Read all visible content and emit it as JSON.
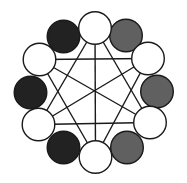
{
  "diagram": {
    "width": 187,
    "height": 183,
    "background": "#ffffff",
    "stroke_color": "#1a1a1a",
    "stroke_width": 1.4,
    "radius": 16.3,
    "colors": {
      "white": "#ffffff",
      "dark": "#222222",
      "gray": "#606060"
    },
    "nodes": [
      {
        "id": "top-left-dark",
        "type": "dark",
        "cx": 63.5,
        "cy": 36.5
      },
      {
        "id": "top-right-gray",
        "type": "gray",
        "cx": 126,
        "cy": 35.5
      },
      {
        "id": "left-dark",
        "type": "dark",
        "cx": 30.5,
        "cy": 92.5
      },
      {
        "id": "right-gray",
        "type": "gray",
        "cx": 157,
        "cy": 91.5
      },
      {
        "id": "bottom-left-dark",
        "type": "dark",
        "cx": 63.5,
        "cy": 147.5
      },
      {
        "id": "bottom-right-gray",
        "type": "gray",
        "cx": 127,
        "cy": 147.5
      },
      {
        "id": "top-white",
        "type": "white",
        "cx": 95,
        "cy": 28
      },
      {
        "id": "upper-left-white",
        "type": "white",
        "cx": 39.5,
        "cy": 59.5
      },
      {
        "id": "upper-right-white",
        "type": "white",
        "cx": 148,
        "cy": 58.5
      },
      {
        "id": "lower-left-white",
        "type": "white",
        "cx": 38.5,
        "cy": 124.5
      },
      {
        "id": "lower-right-white",
        "type": "white",
        "cx": 150,
        "cy": 122.5
      },
      {
        "id": "bottom-white",
        "type": "white",
        "cx": 95.5,
        "cy": 157
      }
    ],
    "edges": [
      [
        "upper-left-white",
        "upper-right-white"
      ],
      [
        "lower-left-white",
        "lower-right-white"
      ],
      [
        "top-white",
        "bottom-white"
      ],
      [
        "top-white",
        "lower-left-white"
      ],
      [
        "top-white",
        "lower-right-white"
      ],
      [
        "bottom-white",
        "upper-left-white"
      ],
      [
        "bottom-white",
        "upper-right-white"
      ],
      [
        "upper-left-white",
        "lower-right-white"
      ],
      [
        "upper-right-white",
        "lower-left-white"
      ]
    ]
  }
}
